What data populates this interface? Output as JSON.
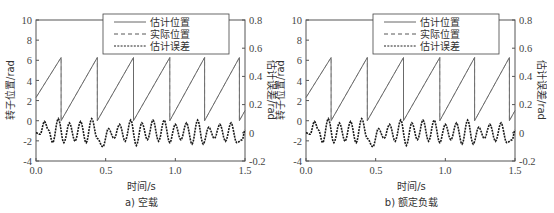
{
  "chart_data": [
    {
      "type": "line",
      "panel_caption": "a) 空载",
      "xlabel": "时间/s",
      "ylabel_left": "转子位置/rad",
      "ylabel_right": "估计误差/rad",
      "xlim": [
        0.0,
        1.5
      ],
      "ylim_left": [
        -4,
        10
      ],
      "ylim_right": [
        -0.2,
        0.8
      ],
      "x_ticks": [
        "0.0",
        "0.5",
        "1.0",
        "1.5"
      ],
      "y_ticks_left": [
        "-4",
        "-2",
        "0",
        "2",
        "4",
        "6",
        "8",
        "10"
      ],
      "y_ticks_right": [
        "-0.2",
        "0",
        "0.2",
        "0.4",
        "0.6",
        "0.8"
      ],
      "grid": false,
      "legend_position": "upper center",
      "legend": [
        "估计位置",
        "实际位置",
        "估计误差"
      ],
      "series": [
        {
          "name": "估计位置",
          "style": "solid",
          "axis": "left",
          "description": "sawtooth 0 to 2π rad",
          "x": [
            0.0,
            0.18,
            0.18,
            0.44,
            0.44,
            0.7,
            0.7,
            0.96,
            0.96,
            1.21,
            1.21,
            1.46,
            1.46,
            1.5
          ],
          "y": [
            2.3,
            6.28,
            0.0,
            6.28,
            0.0,
            6.28,
            0.0,
            6.28,
            0.0,
            6.28,
            0.0,
            6.28,
            0.0,
            1.0
          ]
        },
        {
          "name": "实际位置",
          "style": "dashed",
          "axis": "left",
          "description": "overlaps estimated position",
          "x": [
            0.0,
            0.18,
            0.18,
            0.44,
            0.44,
            0.7,
            0.7,
            0.96,
            0.96,
            1.21,
            1.21,
            1.46,
            1.46,
            1.5
          ],
          "y": [
            2.3,
            6.28,
            0.0,
            6.28,
            0.0,
            6.28,
            0.0,
            6.28,
            0.0,
            6.28,
            0.0,
            6.28,
            0.0,
            1.0
          ]
        },
        {
          "name": "估计误差",
          "style": "dotted",
          "axis": "right",
          "description": "oscillating error approx ±0.1 rad around 0",
          "x": [
            0.0,
            0.03,
            0.06,
            0.09,
            0.12,
            0.16,
            0.2,
            0.24,
            0.28,
            0.32,
            0.36,
            0.4,
            0.44,
            0.48,
            0.52,
            0.56,
            0.6,
            0.64,
            0.68,
            0.72,
            0.76,
            0.8,
            0.84,
            0.88,
            0.92,
            0.96,
            1.0,
            1.04,
            1.08,
            1.12,
            1.16,
            1.2,
            1.24,
            1.28,
            1.32,
            1.36,
            1.4,
            1.44,
            1.48,
            1.5
          ],
          "y": [
            0.0,
            -0.01,
            0.08,
            0.02,
            -0.07,
            0.1,
            -0.07,
            0.07,
            -0.06,
            0.08,
            -0.07,
            0.1,
            -0.04,
            -0.1,
            0.03,
            -0.04,
            0.06,
            -0.06,
            0.09,
            -0.09,
            0.07,
            -0.05,
            0.09,
            -0.06,
            0.09,
            -0.07,
            0.06,
            -0.05,
            0.07,
            -0.08,
            0.09,
            -0.08,
            0.04,
            -0.04,
            0.06,
            -0.06,
            0.07,
            -0.07,
            -0.05,
            0.02
          ]
        }
      ]
    },
    {
      "type": "line",
      "panel_caption": "b) 额定负载",
      "xlabel": "时间/s",
      "ylabel_left": "转子位置/rad",
      "ylabel_right": "估计误差/rad",
      "xlim": [
        0.0,
        1.5
      ],
      "ylim_left": [
        -4,
        10
      ],
      "ylim_right": [
        -0.2,
        0.8
      ],
      "x_ticks": [
        "0.0",
        "0.5",
        "1.0",
        "1.5"
      ],
      "y_ticks_left": [
        "-4",
        "-2",
        "0",
        "2",
        "4",
        "6",
        "8",
        "10"
      ],
      "y_ticks_right": [
        "-0.2",
        "0",
        "0.2",
        "0.4",
        "0.6",
        "0.8"
      ],
      "grid": false,
      "legend_position": "upper center",
      "legend": [
        "估计位置",
        "实际位置",
        "估计误差"
      ],
      "series": [
        {
          "name": "估计位置",
          "style": "solid",
          "axis": "left",
          "description": "sawtooth 0 to 2π rad",
          "x": [
            0.0,
            0.18,
            0.18,
            0.44,
            0.44,
            0.7,
            0.7,
            0.96,
            0.96,
            1.21,
            1.21,
            1.46,
            1.46,
            1.5
          ],
          "y": [
            2.3,
            6.28,
            0.0,
            6.28,
            0.0,
            6.28,
            0.0,
            6.28,
            0.0,
            6.28,
            0.0,
            6.28,
            0.0,
            1.0
          ]
        },
        {
          "name": "实际位置",
          "style": "dashed",
          "axis": "left",
          "description": "overlaps estimated position",
          "x": [
            0.0,
            0.18,
            0.18,
            0.44,
            0.44,
            0.7,
            0.7,
            0.96,
            0.96,
            1.21,
            1.21,
            1.46,
            1.46,
            1.5
          ],
          "y": [
            2.3,
            6.28,
            0.0,
            6.28,
            0.0,
            6.28,
            0.0,
            6.28,
            0.0,
            6.28,
            0.0,
            6.28,
            0.0,
            1.0
          ]
        },
        {
          "name": "估计误差",
          "style": "dotted",
          "axis": "right",
          "description": "oscillating error approx ±0.1 rad around 0",
          "x": [
            0.0,
            0.03,
            0.06,
            0.09,
            0.12,
            0.16,
            0.2,
            0.24,
            0.28,
            0.32,
            0.36,
            0.4,
            0.44,
            0.48,
            0.52,
            0.56,
            0.6,
            0.64,
            0.68,
            0.72,
            0.76,
            0.8,
            0.84,
            0.88,
            0.92,
            0.96,
            1.0,
            1.04,
            1.08,
            1.12,
            1.16,
            1.2,
            1.24,
            1.28,
            1.32,
            1.36,
            1.4,
            1.44,
            1.48,
            1.5
          ],
          "y": [
            0.0,
            -0.01,
            0.08,
            0.02,
            -0.07,
            0.1,
            -0.07,
            0.07,
            -0.06,
            0.08,
            -0.07,
            0.1,
            -0.04,
            -0.1,
            0.03,
            -0.04,
            0.06,
            -0.06,
            0.09,
            -0.09,
            0.07,
            -0.05,
            0.09,
            -0.06,
            0.09,
            -0.07,
            0.06,
            -0.05,
            0.07,
            -0.08,
            0.09,
            -0.08,
            0.04,
            -0.04,
            0.06,
            -0.06,
            0.07,
            -0.07,
            -0.05,
            0.02
          ]
        }
      ]
    }
  ],
  "panels": [
    {
      "caption": "a) 空载",
      "xlabel": "时间/s",
      "ylabel_left": "转子位置/rad",
      "ylabel_right": "估计误差/rad",
      "legend": {
        "item0": "估计位置",
        "item1": "实际位置",
        "item2": "估计误差"
      },
      "x_ticks": {
        "t0": "0.0",
        "t1": "0.5",
        "t2": "1.0",
        "t3": "1.5"
      },
      "y_left": {
        "t0": "10",
        "t1": "8",
        "t2": "6",
        "t3": "4",
        "t4": "2",
        "t5": "0",
        "t6": "-2",
        "t7": "-4"
      },
      "y_right": {
        "t0": "0.8",
        "t1": "0.6",
        "t2": "0.4",
        "t3": "0.2",
        "t4": "0",
        "t5": "-0.2"
      }
    },
    {
      "caption": "b) 额定负载",
      "xlabel": "时间/s",
      "ylabel_left": "转子位置/rad",
      "ylabel_right": "估计误差/rad",
      "legend": {
        "item0": "估计位置",
        "item1": "实际位置",
        "item2": "估计误差"
      },
      "x_ticks": {
        "t0": "0.0",
        "t1": "0.5",
        "t2": "1.0",
        "t3": "1.5"
      },
      "y_left": {
        "t0": "10",
        "t1": "8",
        "t2": "6",
        "t3": "4",
        "t4": "2",
        "t5": "0",
        "t6": "-2",
        "t7": "-4"
      },
      "y_right": {
        "t0": "0.8",
        "t1": "0.6",
        "t2": "0.4",
        "t3": "0.2",
        "t4": "0",
        "t5": "-0.2"
      }
    }
  ],
  "colors": {
    "axis": "#555555",
    "position_line": "#6a6a6a",
    "error_line": "#1a1a1a"
  }
}
